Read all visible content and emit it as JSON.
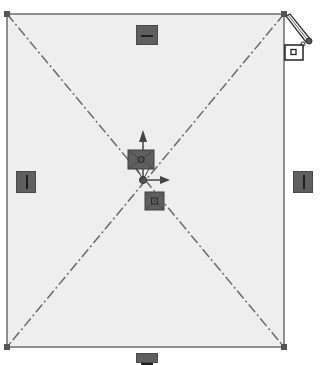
{
  "sketch": {
    "rectangle": {
      "x1": 7,
      "y1": 14,
      "x2": 284,
      "y2": 347
    },
    "center": {
      "x": 146,
      "y": 180
    },
    "colors": {
      "fill": "#eeeeee",
      "edge": "#6e6e6e",
      "construction_line": "#6a6a6a",
      "vertex": "#555555",
      "badge": "#5f5f5f",
      "badge_glyph": "#1e1e1e",
      "axis_arrow": "#444444"
    },
    "relations": [
      {
        "type": "horizontal",
        "edge": "top",
        "x": 136,
        "y": 25
      },
      {
        "type": "vertical",
        "edge": "left",
        "x": 16,
        "y": 171
      },
      {
        "type": "vertical",
        "edge": "right",
        "x": 293,
        "y": 171
      },
      {
        "type": "horizontal",
        "edge": "bottom",
        "x": 136,
        "y": 353
      },
      {
        "type": "coincident",
        "target": "origin",
        "x": 129,
        "y": 150
      },
      {
        "type": "midpoint",
        "target": "origin",
        "x": 145,
        "y": 192
      }
    ],
    "cursor": {
      "type": "sketch-pencil",
      "x": 287,
      "y": 14
    }
  }
}
